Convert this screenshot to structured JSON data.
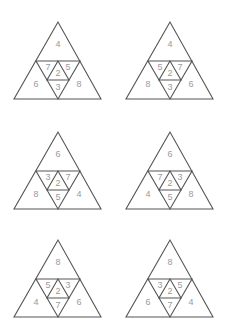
{
  "puzzles": [
    {
      "top": "4",
      "left": "6",
      "right": "8",
      "inner_left": "7",
      "center": "2",
      "inner_right": "5",
      "bottom": "3"
    },
    {
      "top": "4",
      "left": "8",
      "right": "6",
      "inner_left": "5",
      "center": "2",
      "inner_right": "7",
      "bottom": "3"
    },
    {
      "top": "6",
      "left": "8",
      "right": "4",
      "inner_left": "3",
      "center": "2",
      "inner_right": "7",
      "bottom": "5"
    },
    {
      "top": "6",
      "left": "4",
      "right": "8",
      "inner_left": "7",
      "center": "2",
      "inner_right": "3",
      "bottom": "5"
    },
    {
      "top": "8",
      "left": "4",
      "right": "6",
      "inner_left": "5",
      "center": "2",
      "inner_right": "3",
      "bottom": "7"
    },
    {
      "top": "8",
      "left": "6",
      "right": "4",
      "inner_left": "3",
      "center": "2",
      "inner_right": "5",
      "bottom": "7"
    }
  ],
  "colors": {
    "stroke": "#555555",
    "number": "#9a9a9a",
    "background": "#ffffff"
  }
}
